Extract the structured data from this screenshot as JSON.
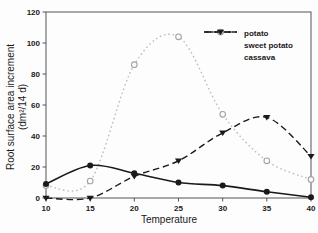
{
  "chart_data": {
    "type": "line",
    "title": "",
    "xlabel": "Temperature",
    "ylabel_line1": "Root surface area increment",
    "ylabel_line2": "(dm²/14 d)",
    "xlim": [
      10,
      40
    ],
    "ylim": [
      0,
      120
    ],
    "x_ticks": [
      10,
      15,
      20,
      25,
      30,
      35,
      40
    ],
    "y_ticks": [
      0,
      20,
      40,
      60,
      80,
      100,
      120
    ],
    "grid": "off",
    "legend_position": "upper-right-inside",
    "frame_color": "#555555",
    "x": [
      10,
      15,
      20,
      25,
      30,
      35,
      40
    ],
    "series": [
      {
        "name": "potato",
        "values": [
          9,
          21,
          16,
          10,
          8,
          4,
          0.5
        ],
        "color": "#1a1a1a",
        "line_style": "solid",
        "marker": "circle-filled",
        "marker_color": "#1a1a1a"
      },
      {
        "name": "sweet potato",
        "values": [
          8,
          11,
          86,
          104,
          54,
          24,
          12
        ],
        "color": "#bcbcbc",
        "line_style": "dotted",
        "marker": "circle-open",
        "marker_color": "#a3a3a3"
      },
      {
        "name": "cassava",
        "values": [
          0,
          0,
          14,
          24,
          42,
          52,
          27
        ],
        "color": "#1a1a1a",
        "line_style": "dashed",
        "marker": "triangle-down-filled",
        "marker_color": "#1a1a1a"
      }
    ]
  }
}
